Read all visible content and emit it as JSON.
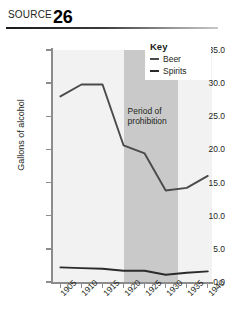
{
  "source": {
    "label": "SOURCE",
    "number": "26"
  },
  "legend": {
    "title": "Key",
    "items": [
      {
        "label": "Beer",
        "color": "#4a4a4a"
      },
      {
        "label": "Spirits",
        "color": "#2b2b2b"
      }
    ]
  },
  "annotation": {
    "prohibition_line1": "Period of",
    "prohibition_line2": "prohibition"
  },
  "chart_data": {
    "type": "line",
    "title": "",
    "xlabel": "",
    "ylabel": "Gallons of alcohol",
    "x": [
      1905,
      1910,
      1915,
      1920,
      1925,
      1930,
      1935,
      1940
    ],
    "categories": [
      "1905",
      "1910",
      "1915",
      "1920",
      "1925",
      "1930",
      "1935",
      "1940"
    ],
    "xlim": [
      1903,
      1941
    ],
    "ylim": [
      0.0,
      35.0
    ],
    "ytick_labels": [
      "0.0",
      "5.0",
      "10.0",
      "15.0",
      "20.0",
      "25.0",
      "30.0",
      "35.0"
    ],
    "yticks": [
      0.0,
      5.0,
      10.0,
      15.0,
      20.0,
      25.0,
      30.0,
      35.0
    ],
    "grid": false,
    "legend_position": "top-right",
    "series": [
      {
        "name": "Beer",
        "color": "#4a4a4a",
        "values": [
          28.0,
          29.8,
          29.8,
          20.6,
          19.4,
          13.8,
          14.2,
          16.0
        ]
      },
      {
        "name": "Spirits",
        "color": "#2b2b2b",
        "values": [
          2.2,
          2.1,
          2.0,
          1.7,
          1.7,
          1.1,
          1.4,
          1.6
        ]
      }
    ],
    "shaded_region": {
      "label": "Period of prohibition",
      "x_start": 1920,
      "x_end": 1933,
      "color": "#c9c9c9"
    },
    "plot_background": "#f2f2f2"
  }
}
